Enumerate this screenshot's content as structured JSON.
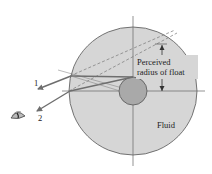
{
  "diagram": {
    "labels": {
      "ray1": "1",
      "ray2": "2",
      "perceived_line1": "Perceived",
      "perceived_line2": "radius of float",
      "fluid": "Fluid"
    },
    "colors": {
      "fluid_fill": "#d4d4d4",
      "float_fill": "#a8a8a8",
      "outline": "#555555",
      "ray": "#6e6e6e",
      "axis": "#666666"
    },
    "icons": {
      "observer": "eye-icon"
    }
  }
}
